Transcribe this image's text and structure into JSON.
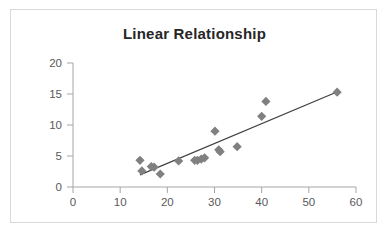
{
  "chart_data": {
    "type": "scatter",
    "title": "Linear Relationship",
    "xlabel": "",
    "ylabel": "",
    "xlim": [
      0,
      60
    ],
    "ylim": [
      0,
      20
    ],
    "xticks": [
      0,
      10,
      20,
      30,
      40,
      50,
      60
    ],
    "yticks": [
      0,
      5,
      10,
      15,
      20
    ],
    "grid": false,
    "legend": null,
    "marker_shape": "diamond",
    "marker_color": "#808080",
    "trendline": {
      "visible": true,
      "color": "#404040",
      "x_start": 14.2,
      "y_start": 1.95,
      "x_end": 56.2,
      "y_end": 15.4
    },
    "points": [
      {
        "x": 14.2,
        "y": 4.3
      },
      {
        "x": 14.6,
        "y": 2.6
      },
      {
        "x": 16.6,
        "y": 3.3
      },
      {
        "x": 17.2,
        "y": 3.2
      },
      {
        "x": 18.5,
        "y": 2.1
      },
      {
        "x": 22.4,
        "y": 4.2
      },
      {
        "x": 25.8,
        "y": 4.3
      },
      {
        "x": 26.4,
        "y": 4.3
      },
      {
        "x": 27.2,
        "y": 4.5
      },
      {
        "x": 27.9,
        "y": 4.7
      },
      {
        "x": 30.1,
        "y": 9.0
      },
      {
        "x": 30.9,
        "y": 6.0
      },
      {
        "x": 31.2,
        "y": 5.7
      },
      {
        "x": 34.8,
        "y": 6.5
      },
      {
        "x": 40.0,
        "y": 11.4
      },
      {
        "x": 40.9,
        "y": 13.8
      },
      {
        "x": 56.0,
        "y": 15.3
      }
    ]
  },
  "axis": {
    "y_tick_labels": [
      "20",
      "15",
      "10",
      "5",
      "0"
    ],
    "x_tick_labels": [
      "0",
      "10",
      "20",
      "30",
      "40",
      "50",
      "60"
    ]
  }
}
